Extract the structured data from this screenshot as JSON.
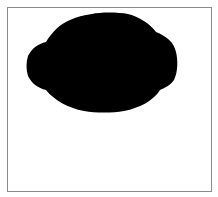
{
  "image": {
    "description": "Solid black rounded blob silhouette on white background inside a thin gray frame",
    "shape_color": "#000000",
    "background_color": "#ffffff",
    "frame_color": "#8a8a8a"
  }
}
